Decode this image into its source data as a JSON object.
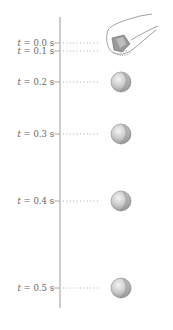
{
  "diagram": {
    "axis": {
      "x": 60,
      "y_top": 17,
      "y_bottom": 308,
      "color": "#9a9a9a"
    },
    "ball": {
      "x": 121,
      "radius": 10,
      "fill": "#c8c8c8",
      "stroke": "#8a8a8a"
    },
    "ticks": [
      {
        "label_var": "t",
        "label_rest": " = 0.0 s",
        "y": 43,
        "ball": false
      },
      {
        "label_var": "t",
        "label_rest": " = 0.1 s",
        "y": 51,
        "ball": false
      },
      {
        "label_var": "t",
        "label_rest": " = 0.2 s",
        "y": 82,
        "ball": true
      },
      {
        "label_var": "t",
        "label_rest": " = 0.3 s",
        "y": 134,
        "ball": true
      },
      {
        "label_var": "t",
        "label_rest": " = 0.4 s",
        "y": 201,
        "ball": true
      },
      {
        "label_var": "t",
        "label_rest": " = 0.5 s",
        "y": 288,
        "ball": true
      }
    ],
    "hand": {
      "description": "hand releasing ball",
      "x": 118,
      "y": 28
    }
  }
}
